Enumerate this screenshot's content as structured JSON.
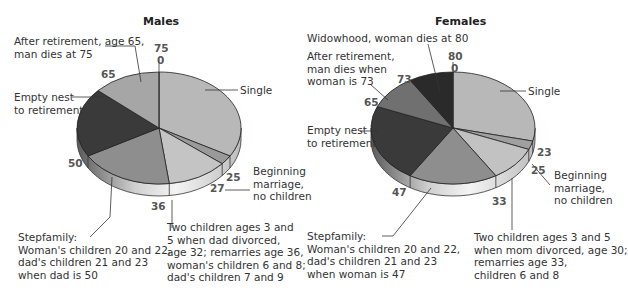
{
  "chart_data": [
    {
      "type": "pie",
      "title": "Males",
      "start_age": 0,
      "end_age": 75,
      "boundaries": [
        0,
        25,
        27,
        36,
        50,
        65,
        75
      ],
      "slices": [
        {
          "label": "Single",
          "from": 0,
          "to": 25,
          "value": 25,
          "color": "#b8b8b8"
        },
        {
          "label": "Beginning marriage, no children",
          "from": 25,
          "to": 27,
          "value": 2,
          "color": "#9a9a9a"
        },
        {
          "label": "Two children ages 3 and 5 when dad divorced, age 32; remarries age 36, woman's children 6 and 8; dad's children 7 and 9",
          "from": 27,
          "to": 36,
          "value": 9,
          "color": "#c4c4c4"
        },
        {
          "label": "Stepfamily: Woman's children 20 and 22, dad's children 21 and 23 when dad is 50",
          "from": 36,
          "to": 50,
          "value": 14,
          "color": "#8e8e8e"
        },
        {
          "label": "Empty nest to retirement",
          "from": 50,
          "to": 65,
          "value": 15,
          "color": "#3a3a3a"
        },
        {
          "label": "After retirement, age 65, man dies at 75",
          "from": 65,
          "to": 75,
          "value": 10,
          "color": "#a6a6a6"
        }
      ]
    },
    {
      "type": "pie",
      "title": "Females",
      "start_age": 0,
      "end_age": 80,
      "boundaries": [
        0,
        23,
        25,
        33,
        47,
        65,
        73,
        80
      ],
      "slices": [
        {
          "label": "Single",
          "from": 0,
          "to": 23,
          "value": 23,
          "color": "#b8b8b8"
        },
        {
          "label": "Beginning marriage, no children",
          "from": 23,
          "to": 25,
          "value": 2,
          "color": "#a0a0a0"
        },
        {
          "label": "Two children ages 3 and 5 when mom divorced, age 30; remarries age 33, children 6 and 8",
          "from": 25,
          "to": 33,
          "value": 8,
          "color": "#c2c2c2"
        },
        {
          "label": "Stepfamily: Woman's children 20 and 22, dad's children 21 and 23 when woman is 47",
          "from": 33,
          "to": 47,
          "value": 14,
          "color": "#8e8e8e"
        },
        {
          "label": "Empty nest to retirement",
          "from": 47,
          "to": 65,
          "value": 18,
          "color": "#3a3a3a"
        },
        {
          "label": "After retirement, man dies when woman is 73",
          "from": 65,
          "to": 73,
          "value": 8,
          "color": "#707070"
        },
        {
          "label": "Widowhood, woman dies at 80",
          "from": 73,
          "to": 80,
          "value": 7,
          "color": "#2a2a2a"
        }
      ]
    }
  ],
  "males": {
    "title": "Males",
    "labels": {
      "after_retirement": [
        "After retirement, age 65,",
        "man dies at 75"
      ],
      "single": "Single",
      "empty_nest": [
        "Empty nest",
        "to retirement"
      ],
      "beginning": [
        "Beginning",
        "marriage,",
        "no children"
      ],
      "stepfamily": [
        "Stepfamily:",
        "Woman's children 20 and 22,",
        "dad's children 21 and 23",
        "when dad is 50"
      ],
      "two_children": [
        "Two children ages 3 and",
        "5 when dad divorced,",
        "age 32; remarries age 36,",
        "woman's children 6 and 8;",
        "dad's children 7 and 9"
      ]
    },
    "numbers": {
      "n75": "75",
      "n0": "0",
      "n65": "65",
      "n50": "50",
      "n36": "36",
      "n27": "27",
      "n25": "25"
    }
  },
  "females": {
    "title": "Females",
    "labels": {
      "widowhood": "Widowhood, woman dies at 80",
      "after_retirement": [
        "After retirement,",
        "man dies when",
        "woman is 73"
      ],
      "single": "Single",
      "empty_nest": [
        "Empty nest",
        "to retirement"
      ],
      "beginning": [
        "Beginning",
        "marriage,",
        "no children"
      ],
      "stepfamily": [
        "Stepfamily:",
        "Woman's children 20 and 22,",
        "dad's children 21 and 23",
        "when woman is 47"
      ],
      "two_children": [
        "Two children ages 3 and 5",
        "when mom divorced, age 30;",
        "remarries age 33,",
        "children 6 and 8"
      ]
    },
    "numbers": {
      "n80": "80",
      "n0": "0",
      "n73": "73",
      "n65": "65",
      "n47": "47",
      "n33": "33",
      "n25": "25",
      "n23": "23"
    }
  }
}
